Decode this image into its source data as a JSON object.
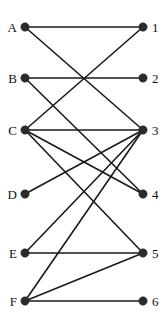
{
  "figure": {
    "kind": "bipartite-graph-diagram",
    "width": 168,
    "height": 327,
    "background_color": "#ffffff",
    "node_color": "#2b2b2b",
    "edge_color": "#1a1a1a",
    "label_color": "#111111"
  },
  "left_nodes": [
    {
      "id": "A",
      "label": "A",
      "x": 25,
      "y": 27
    },
    {
      "id": "B",
      "label": "B",
      "x": 25,
      "y": 78
    },
    {
      "id": "C",
      "label": "C",
      "x": 25,
      "y": 130
    },
    {
      "id": "D",
      "label": "D",
      "x": 25,
      "y": 194
    },
    {
      "id": "E",
      "label": "E",
      "x": 25,
      "y": 253
    },
    {
      "id": "F",
      "label": "F",
      "x": 25,
      "y": 301
    }
  ],
  "right_nodes": [
    {
      "id": "1",
      "label": "1",
      "x": 143,
      "y": 27
    },
    {
      "id": "2",
      "label": "2",
      "x": 143,
      "y": 78
    },
    {
      "id": "3",
      "label": "3",
      "x": 143,
      "y": 130
    },
    {
      "id": "4",
      "label": "4",
      "x": 143,
      "y": 194
    },
    {
      "id": "5",
      "label": "5",
      "x": 143,
      "y": 253
    },
    {
      "id": "6",
      "label": "6",
      "x": 143,
      "y": 301
    }
  ],
  "edges": [
    {
      "from": "A",
      "to": "1"
    },
    {
      "from": "A",
      "to": "3"
    },
    {
      "from": "B",
      "to": "2"
    },
    {
      "from": "B",
      "to": "4"
    },
    {
      "from": "C",
      "to": "1"
    },
    {
      "from": "C",
      "to": "3"
    },
    {
      "from": "C",
      "to": "4"
    },
    {
      "from": "C",
      "to": "5"
    },
    {
      "from": "D",
      "to": "3"
    },
    {
      "from": "E",
      "to": "3"
    },
    {
      "from": "E",
      "to": "5"
    },
    {
      "from": "F",
      "to": "3"
    },
    {
      "from": "F",
      "to": "5"
    },
    {
      "from": "F",
      "to": "6"
    }
  ],
  "node_radius": 4.2,
  "label_offsets": {
    "left_dx": -8,
    "right_dx": 9
  }
}
